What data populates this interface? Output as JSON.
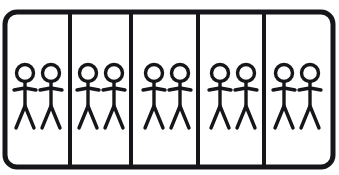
{
  "diagram": {
    "title": "Ten stick figures arranged in five equal groups of two",
    "type": "grouping-diagram",
    "total_figures": 10,
    "group_count": 5,
    "figures_per_group": 2,
    "colors": {
      "ink": "#16161a",
      "background": "#ffffff",
      "cell_fill": "#ffffff"
    },
    "frame": {
      "x": 5,
      "y": 12,
      "width": 328,
      "height": 155,
      "corner_radius": 12,
      "stroke_width": 5
    },
    "dividers": {
      "stroke_width": 4,
      "x_positions": [
        70,
        131,
        198,
        264
      ],
      "y_top": 14,
      "y_bottom": 165
    },
    "figure_geometry": {
      "head_radius": 8.5,
      "head_center_y": 73,
      "body_top_y": 81.5,
      "body_bottom_y": 106,
      "arm_y": 88,
      "arm_half_width": 11,
      "arm_drop": 2,
      "leg_bottom_y": 128,
      "leg_half_spread": 9,
      "stroke_width": 3.4
    },
    "groups": [
      {
        "id": "group-1",
        "label": "Group 1",
        "count": 2,
        "cell_left": 5,
        "cell_right": 70,
        "figure_x": [
          25,
          51
        ]
      },
      {
        "id": "group-2",
        "label": "Group 2",
        "count": 2,
        "cell_left": 70,
        "cell_right": 131,
        "figure_x": [
          88,
          114
        ]
      },
      {
        "id": "group-3",
        "label": "Group 3",
        "count": 2,
        "cell_left": 131,
        "cell_right": 198,
        "figure_x": [
          154,
          180
        ]
      },
      {
        "id": "group-4",
        "label": "Group 4",
        "count": 2,
        "cell_left": 198,
        "cell_right": 264,
        "figure_x": [
          220,
          246
        ]
      },
      {
        "id": "group-5",
        "label": "Group 5",
        "count": 2,
        "cell_left": 264,
        "cell_right": 333,
        "figure_x": [
          284,
          310
        ]
      }
    ]
  }
}
